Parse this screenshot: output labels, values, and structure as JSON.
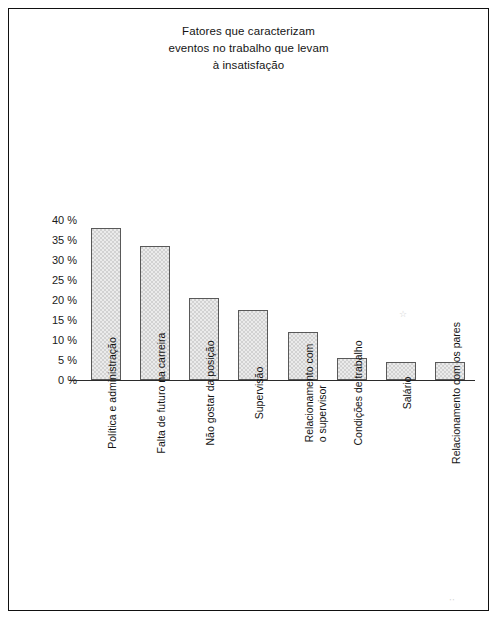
{
  "figure": {
    "title_lines": [
      "Fatores que caracterizam",
      "eventos no trabalho que levam",
      "à insatisfação"
    ],
    "frame_color": "#111111",
    "bar_fill_color": "#d2d2d2",
    "bar_border_color": "#595959"
  },
  "chart_data": {
    "type": "bar",
    "title": "Fatores que caracterizam eventos no trabalho que levam à insatisfação",
    "xlabel": "",
    "ylabel": "",
    "ylim": [
      0,
      40
    ],
    "grid": false,
    "legend": "none",
    "y_tick_labels": [
      "40 %",
      "35 %",
      "30 %",
      "25 %",
      "20 %",
      "15 %",
      "10 %",
      "5 %",
      "0 %"
    ],
    "y_tick_values": [
      40,
      35,
      30,
      25,
      20,
      15,
      10,
      5,
      0
    ],
    "categories": [
      "Política e administração",
      "Falta de futuro na carreira",
      "Não gostar da posição",
      "Supervisão",
      "Relacionamento com o supervisor",
      "Condições de trabalho",
      "Salário",
      "Relacionamento com os pares"
    ],
    "category_label_lines": [
      [
        "Política e administração"
      ],
      [
        "Falta de futuro na carreira"
      ],
      [
        "Não gostar da posição"
      ],
      [
        "Supervisão"
      ],
      [
        "Relacionamento com",
        "o supervisor"
      ],
      [
        "Condições de trabalho"
      ],
      [
        "Salário"
      ],
      [
        "Relacionamento com os pares"
      ]
    ],
    "values": [
      38,
      33.5,
      20.5,
      17.5,
      12,
      5.5,
      4.5,
      4.5
    ],
    "unit": "%"
  }
}
